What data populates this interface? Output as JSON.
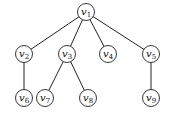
{
  "diagram": {
    "type": "tree",
    "nodes": [
      {
        "id": "v1",
        "label": "v",
        "sub": "1",
        "x": 86,
        "y": 12
      },
      {
        "id": "v2",
        "label": "v",
        "sub": "2",
        "x": 24,
        "y": 54
      },
      {
        "id": "v3",
        "label": "v",
        "sub": "3",
        "x": 67,
        "y": 54
      },
      {
        "id": "v4",
        "label": "v",
        "sub": "4",
        "x": 108,
        "y": 54
      },
      {
        "id": "v5",
        "label": "v",
        "sub": "5",
        "x": 151,
        "y": 54
      },
      {
        "id": "v6",
        "label": "v",
        "sub": "6",
        "x": 24,
        "y": 98
      },
      {
        "id": "v7",
        "label": "v",
        "sub": "7",
        "x": 45,
        "y": 98
      },
      {
        "id": "v8",
        "label": "v",
        "sub": "8",
        "x": 88,
        "y": 98
      },
      {
        "id": "v9",
        "label": "v",
        "sub": "9",
        "x": 151,
        "y": 98
      }
    ],
    "edges": [
      [
        "v1",
        "v2"
      ],
      [
        "v1",
        "v3"
      ],
      [
        "v1",
        "v4"
      ],
      [
        "v1",
        "v5"
      ],
      [
        "v2",
        "v6"
      ],
      [
        "v3",
        "v7"
      ],
      [
        "v3",
        "v8"
      ],
      [
        "v5",
        "v9"
      ]
    ],
    "node_radius": 8.5
  }
}
